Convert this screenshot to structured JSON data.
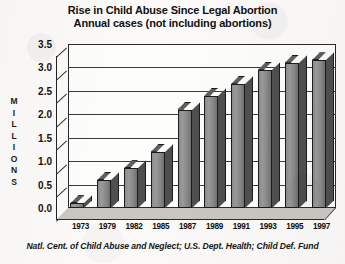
{
  "chart_data": {
    "type": "bar",
    "title": "Rise in Child Abuse Since Legal Abortion",
    "subtitle": "Annual cases (not including abortions)",
    "xlabel": "",
    "ylabel": "MILLIONS",
    "ylim": [
      0.0,
      3.5
    ],
    "ytick_step": 0.5,
    "grid": true,
    "legend": null,
    "source_note": "Natl. Cent. of Child Abuse and Neglect; U.S. Dept. Health; Child Def. Fund",
    "categories": [
      "1973",
      "1979",
      "1982",
      "1985",
      "1987",
      "1989",
      "1991",
      "1993",
      "1995",
      "1997"
    ],
    "values": [
      0.1,
      0.6,
      0.85,
      1.2,
      2.1,
      2.4,
      2.65,
      2.95,
      3.1,
      3.15
    ],
    "ytick_labels": [
      "3.5",
      "3.0",
      "2.5",
      "2.0",
      "1.5",
      "1.0",
      "0.5",
      "0.0"
    ],
    "ytick_values": [
      3.5,
      3.0,
      2.5,
      2.0,
      1.5,
      1.0,
      0.5,
      0.0
    ],
    "ylabel_letters": [
      "M",
      "I",
      "L",
      "L",
      "I",
      "O",
      "N",
      "S"
    ],
    "style": {
      "bar_face": "#8d8d8d",
      "bar_top": "#5e5e5e",
      "bar_side": "#4f4f4f",
      "bar_outline": "#1c1c1c",
      "plot_background": "#fdfdfb",
      "floor": "#c9c7c2",
      "axis": "#232323",
      "page_background": "#fbfaf8",
      "text": "#111111"
    }
  }
}
